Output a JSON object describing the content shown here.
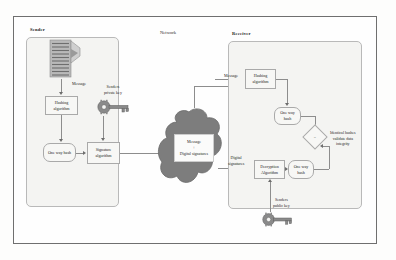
{
  "diagram": {
    "sections": {
      "sender": {
        "label": "Sender"
      },
      "network": {
        "label": "Network"
      },
      "receiver": {
        "label": "Receiver"
      }
    },
    "sender_flow": {
      "document_icon": "document-stack-icon",
      "message_label": "Message",
      "hashing_algorithm": "Hashing\nalgorithm",
      "one_way_hash": "One way\nhash",
      "signature_algorithm": "Signature\nalgorithm",
      "private_key_label": "Senders\nprivate key",
      "private_key_icon": "key-icon"
    },
    "network_cloud": {
      "payload_line1": "Message",
      "payload_operator": "+",
      "payload_line2": "Digital signatures"
    },
    "receiver_flow": {
      "message_label": "Message",
      "hashing_algorithm": "Hashing\nalgorithm",
      "one_way_hash_top": "One way\nhash",
      "digital_signatures_label": "Digital\nsignatures",
      "decryption_algorithm": "Decryption\nAlgorithm",
      "one_way_hash_bottom": "One way\nhash",
      "comparator_symbol": "=",
      "validation_text": "Identical hashes\nvalidate data\nintegrity",
      "public_key_label": "Senders\npublic key",
      "public_key_icon": "key-icon"
    },
    "colors": {
      "frame_border": "#6f6f6f",
      "panel_fill": "#f4f4f2",
      "panel_border": "#b9b9b9",
      "node_fill": "#f7f7f5",
      "node_border": "#a9a9a9",
      "cloud_fill": "#7d7d7d",
      "connector": "#8d8d8d",
      "page_background": "#fdfdfc"
    }
  }
}
